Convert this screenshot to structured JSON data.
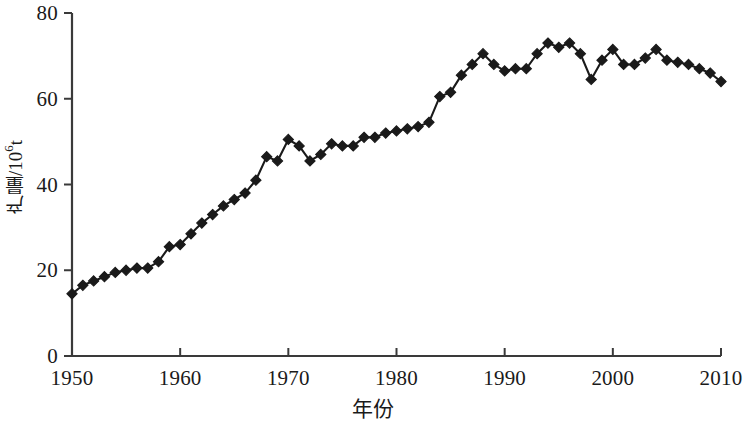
{
  "chart_data": {
    "type": "line",
    "title": "",
    "xlabel": "年份",
    "ylabel": "产量/10⁶t",
    "ylabel_parts": {
      "prefix": "产量/10",
      "exponent": "6",
      "suffix": "t"
    },
    "xlim": [
      1950,
      2010
    ],
    "ylim": [
      0,
      80
    ],
    "xticks": [
      1950,
      1960,
      1970,
      1980,
      1990,
      2000,
      2010
    ],
    "yticks": [
      0,
      20,
      40,
      60,
      80
    ],
    "xtick_labels": [
      "1950",
      "1960",
      "1970",
      "1980",
      "1990",
      "2000",
      "2010"
    ],
    "ytick_labels": [
      "0",
      "20",
      "40",
      "60",
      "80"
    ],
    "grid": false,
    "legend": "none",
    "marker": "diamond",
    "marker_color": "#1a1a1a",
    "line_color": "#1a1a1a",
    "x": [
      1950,
      1951,
      1952,
      1953,
      1954,
      1955,
      1956,
      1957,
      1958,
      1959,
      1960,
      1961,
      1962,
      1963,
      1964,
      1965,
      1966,
      1967,
      1968,
      1969,
      1970,
      1971,
      1972,
      1973,
      1974,
      1975,
      1976,
      1977,
      1978,
      1979,
      1980,
      1981,
      1982,
      1983,
      1984,
      1985,
      1986,
      1987,
      1988,
      1989,
      1990,
      1991,
      1992,
      1993,
      1994,
      1995,
      1996,
      1997,
      1998,
      1999,
      2000,
      2001,
      2002,
      2003,
      2004,
      2005,
      2006,
      2007,
      2008,
      2009,
      2010
    ],
    "values": [
      14.5,
      16.5,
      17.5,
      18.5,
      19.5,
      20.0,
      20.5,
      20.5,
      22.0,
      25.5,
      26.0,
      28.5,
      31.0,
      33.0,
      35.0,
      36.5,
      38.0,
      41.0,
      46.5,
      45.5,
      50.5,
      49.0,
      45.5,
      47.0,
      49.5,
      49.0,
      49.0,
      51.0,
      51.0,
      52.0,
      52.5,
      53.0,
      53.5,
      54.5,
      60.5,
      61.5,
      65.5,
      68.0,
      70.5,
      68.0,
      66.5,
      67.0,
      67.0,
      70.5,
      73.0,
      72.0,
      73.0,
      70.5,
      64.5,
      69.0,
      71.5,
      68.0,
      68.0,
      69.5,
      71.5,
      69.0,
      68.5,
      68.0,
      67.0,
      66.0,
      64.0
    ]
  },
  "axes": {
    "y_axis_name": "production-axis",
    "x_axis_name": "year-axis"
  }
}
